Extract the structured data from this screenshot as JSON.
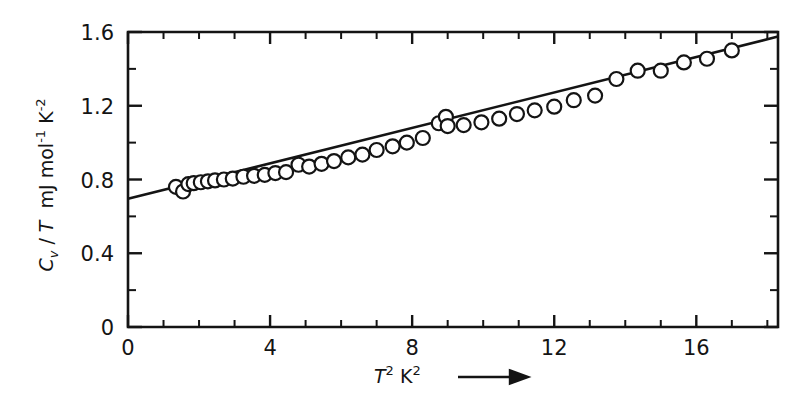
{
  "figure": {
    "name": "heat-capacity-plot",
    "background": "#ffffff",
    "ink_color": "#141414"
  },
  "chart_data": {
    "type": "scatter",
    "title": "",
    "subtitle": "",
    "xlabel": "T 2 K 2",
    "xlabel_parts": {
      "symbol": "T",
      "symbol_exponent": "2",
      "unit": "K",
      "unit_exponent": "2",
      "trailing_icon": "right-arrow"
    },
    "ylabel": "C v / T  mJ mol -1 K -2",
    "ylabel_parts": {
      "symbol": "C",
      "symbol_subscript": "v",
      "divider": "/",
      "denominator": "T",
      "unit_prefix": "mJ mol",
      "unit_prefix_exponent": "-1",
      "unit_suffix": "K",
      "unit_suffix_exponent": "-2"
    },
    "xlim": [
      0,
      18.3
    ],
    "ylim": [
      0,
      1.6
    ],
    "xticks": [
      0,
      4,
      8,
      12,
      16
    ],
    "xticklabels": [
      "0",
      "4",
      "8",
      "12",
      "16"
    ],
    "yticks": [
      0,
      0.4,
      0.8,
      1.2,
      1.6
    ],
    "yticklabels": [
      "0",
      "0.4",
      "0.8",
      "1.2",
      "1.6"
    ],
    "x_minor_step": 1,
    "y_minor_step": 0.2,
    "grid": false,
    "legend": null,
    "marker": "open-circle",
    "marker_radius_px": 7,
    "series": [
      {
        "name": "Cv/T data",
        "x": [
          1.35,
          1.55,
          1.7,
          1.85,
          2.05,
          2.25,
          2.45,
          2.7,
          2.95,
          3.25,
          3.55,
          3.85,
          4.15,
          4.45,
          4.8,
          5.1,
          5.45,
          5.8,
          6.2,
          6.6,
          7.0,
          7.45,
          7.85,
          8.3,
          8.75,
          8.95,
          9.0,
          9.45,
          9.95,
          10.45,
          10.95,
          11.45,
          12.0,
          12.55,
          13.15,
          13.75,
          14.35,
          15.0,
          15.65,
          16.3,
          17.0
        ],
        "y": [
          0.76,
          0.735,
          0.775,
          0.78,
          0.785,
          0.79,
          0.795,
          0.8,
          0.805,
          0.815,
          0.82,
          0.825,
          0.835,
          0.84,
          0.88,
          0.87,
          0.885,
          0.9,
          0.92,
          0.935,
          0.96,
          0.98,
          1.0,
          1.025,
          1.105,
          1.14,
          1.09,
          1.095,
          1.11,
          1.13,
          1.155,
          1.175,
          1.195,
          1.23,
          1.255,
          1.345,
          1.39,
          1.39,
          1.435,
          1.455,
          1.5
        ]
      }
    ],
    "fit_line": {
      "name": "linear-fit",
      "x": [
        0,
        18.3
      ],
      "y": [
        0.695,
        1.575
      ],
      "intercept": 0.695,
      "slope": 0.0481
    }
  },
  "axes_geometry": {
    "plot_left_px": 128,
    "plot_right_px": 778,
    "plot_top_px": 32,
    "plot_bottom_px": 327
  }
}
